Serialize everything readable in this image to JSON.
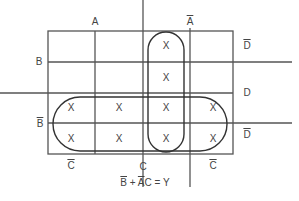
{
  "diagram": {
    "type": "karnaugh-map",
    "column_labels_top": [
      {
        "text": "A",
        "overline": false
      },
      {
        "text": "A",
        "overline": true
      }
    ],
    "row_labels_left": [
      {
        "text": "B",
        "overline": false
      },
      {
        "text": "B",
        "overline": true
      }
    ],
    "row_labels_right": [
      {
        "text": "D",
        "overline": true
      },
      {
        "text": "D",
        "overline": false
      },
      {
        "text": "D",
        "overline": true
      }
    ],
    "column_labels_bottom": [
      {
        "text": "C",
        "overline": true
      },
      {
        "text": "C",
        "overline": false
      },
      {
        "text": "C",
        "overline": true
      }
    ],
    "cells": [
      [
        "",
        "",
        "X",
        ""
      ],
      [
        "",
        "",
        "X",
        ""
      ],
      [
        "X",
        "X",
        "X",
        "X"
      ],
      [
        "X",
        "X",
        "X",
        "X"
      ]
    ],
    "groups": [
      {
        "name": "B-bar",
        "rows": [
          2,
          3
        ],
        "cols": [
          0,
          1,
          2,
          3
        ]
      },
      {
        "name": "A-bar C",
        "rows": [
          0,
          1,
          2,
          3
        ],
        "cols": [
          2
        ]
      }
    ],
    "expression": {
      "term1": "B",
      "plus": " + ",
      "term2_bar": "A",
      "term2_rest": "C",
      "equals": " = Y"
    },
    "cell_mark": "X",
    "line_color": "#555555"
  }
}
